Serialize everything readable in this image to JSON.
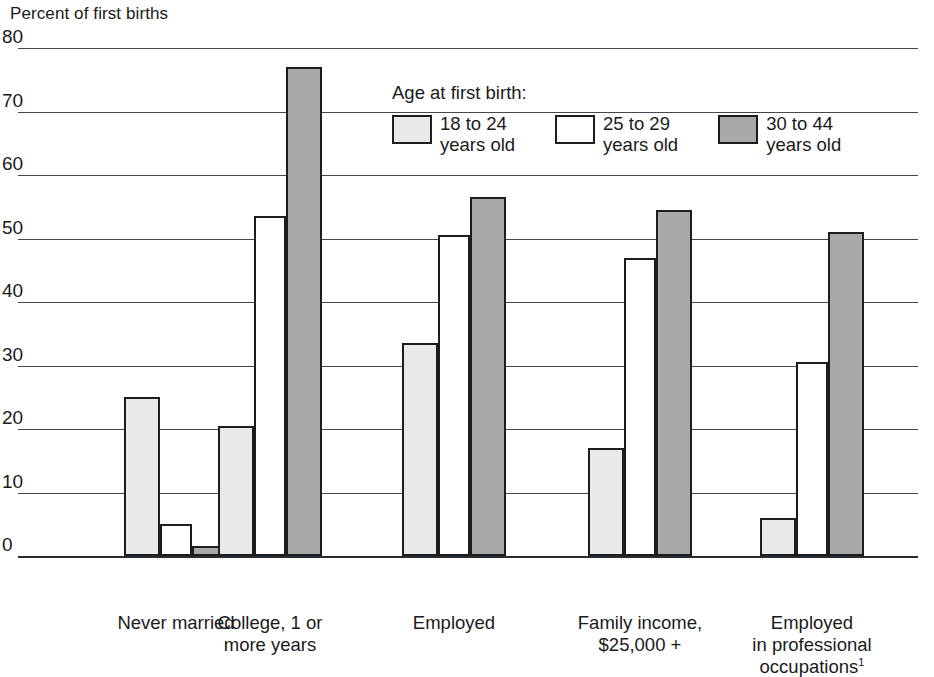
{
  "chart_data": {
    "type": "bar",
    "title": "Percent of first births",
    "xlabel": "",
    "ylabel": "Percent of first births",
    "ylim": [
      0,
      80
    ],
    "yticks": [
      0,
      10,
      20,
      30,
      40,
      50,
      60,
      70,
      80
    ],
    "ytick_labels": [
      "0",
      "10",
      "20",
      "30",
      "40",
      "50",
      "60",
      "70",
      "80"
    ],
    "grid": true,
    "legend_position": "upper center",
    "legend_title": "Age at first birth:",
    "categories": [
      "Never married",
      "College, 1 or more years",
      "Employed",
      "Family income, $25,000 +",
      "Employed in professional occupations"
    ],
    "category_labels": [
      [
        "Never married"
      ],
      [
        "College, 1 or",
        "more years"
      ],
      [
        "Employed"
      ],
      [
        "Family income,",
        "$25,000 +"
      ],
      [
        "Employed",
        "in professional",
        "occupations"
      ]
    ],
    "series": [
      {
        "name": "18 to 24 years old",
        "color": "#e9e9e9",
        "values": [
          25,
          20.5,
          33.5,
          17,
          6
        ]
      },
      {
        "name": "25 to 29 years old",
        "color": "#ffffff",
        "values": [
          5,
          53.5,
          50.5,
          47,
          30.5
        ]
      },
      {
        "name": "30 to 44 years old",
        "color": "#a9a9a9",
        "values": [
          1.5,
          77,
          56.5,
          54.5,
          51
        ]
      }
    ],
    "footnote_marker": "1",
    "footnote_on_category": 4,
    "colors": {
      "series_18_24": "#e9e9e9",
      "series_25_29": "#ffffff",
      "series_30_44": "#a9a9a9",
      "bar_outline": "#1b1e20",
      "gridline": "#44484a",
      "axis": "#2a2d2f",
      "text": "#1a1a1a",
      "background": "#ffffff"
    }
  },
  "legend": {
    "title": "Age at first birth:",
    "items": [
      {
        "label_line1": "18 to 24",
        "label_line2": "years old"
      },
      {
        "label_line1": "25 to 29",
        "label_line2": "years old"
      },
      {
        "label_line1": "30 to 44",
        "label_line2": "years old"
      }
    ]
  }
}
